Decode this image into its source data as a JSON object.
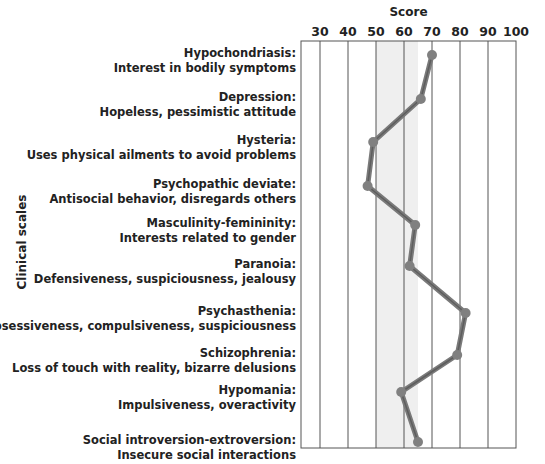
{
  "chart_data": {
    "type": "line",
    "orientation": "horizontal-profile",
    "title": "",
    "xlabel": "Score",
    "ylabel": "Clinical scales",
    "xlim": [
      23,
      100
    ],
    "x_ticks": [
      30,
      40,
      50,
      60,
      70,
      80,
      90,
      100
    ],
    "shaded_band": {
      "from": 50,
      "to": 65,
      "color": "#efefef"
    },
    "grid": true,
    "categories": [
      {
        "name": "Hypochondriasis:",
        "desc": "Interest in bodily symptoms"
      },
      {
        "name": "Depression:",
        "desc": "Hopeless, pessimistic attitude"
      },
      {
        "name": "Hysteria:",
        "desc": "Uses physical ailments to avoid problems"
      },
      {
        "name": "Psychopathic deviate:",
        "desc": "Antisocial behavior, disregards others"
      },
      {
        "name": "Masculinity-femininity:",
        "desc": "Interests related to gender"
      },
      {
        "name": "Paranoia:",
        "desc": "Defensiveness, suspiciousness, jealousy"
      },
      {
        "name": "Psychasthenia:",
        "desc": "Obsessiveness, compulsiveness, suspiciousness"
      },
      {
        "name": "Schizophrenia:",
        "desc": "Loss of touch with reality, bizarre delusions"
      },
      {
        "name": "Hypomania:",
        "desc": "Impulsiveness, overactivity"
      },
      {
        "name": "Social introversion-extroversion:",
        "desc": "Insecure social interactions"
      }
    ],
    "series": [
      {
        "name": "Score",
        "color": "#7a7a7a",
        "values": [
          70,
          66,
          49,
          47,
          64,
          62,
          82,
          79,
          59,
          65
        ]
      }
    ]
  }
}
